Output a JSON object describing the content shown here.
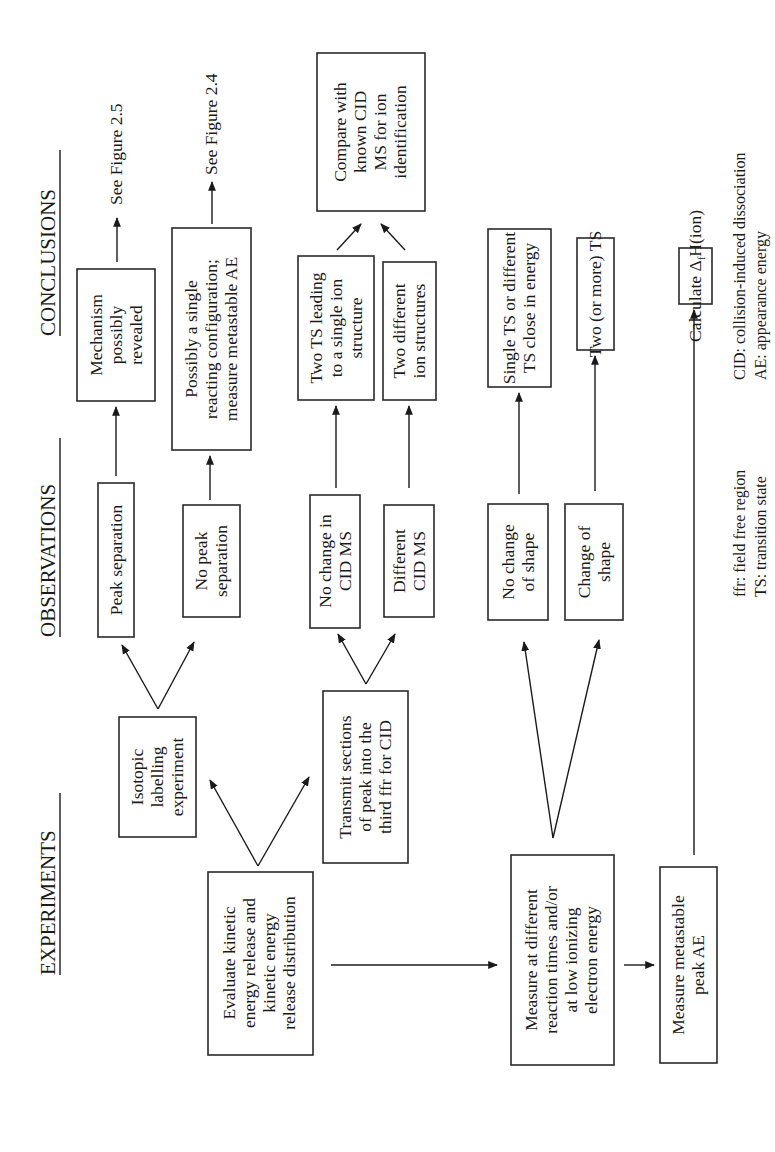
{
  "headers": {
    "experiments": "EXPERIMENTS",
    "observations": "OBSERVATIONS",
    "conclusions": "CONCLUSIONS"
  },
  "experiments": {
    "evaluate": [
      "Evaluate kinetic",
      "energy release and",
      "kinetic energy",
      "release distribution"
    ],
    "isotopic": [
      "Isotopic",
      "labelling",
      "experiment"
    ],
    "transmit": [
      "Transmit sections",
      "of peak into the",
      "third ffr for CID"
    ],
    "measure": [
      "Measure at different",
      "reaction times and/or",
      "at low ionizing",
      "electron energy"
    ],
    "metastable_ae": [
      "Measure metastable",
      "peak AE"
    ]
  },
  "observations": {
    "peak_separation": [
      "Peak  separation"
    ],
    "no_peak_separation": [
      "No peak",
      "separation"
    ],
    "no_change_cid": [
      "No change in",
      "CID MS"
    ],
    "different_cid": [
      "Different",
      "CID MS"
    ],
    "no_change_shape": [
      "No change",
      "of shape"
    ],
    "change_shape": [
      "Change of",
      "shape"
    ]
  },
  "conclusions": {
    "mechanism": [
      "Mechanism",
      "possibly",
      "revealed"
    ],
    "single_config": [
      "Possibly a single",
      "reacting configuration;",
      "measure metastable AE"
    ],
    "two_ts_single": [
      "Two TS leading",
      "to a single ion",
      "structure"
    ],
    "two_structures": [
      "Two different",
      "ion structures"
    ],
    "compare": [
      "Compare with",
      "known CID",
      "MS for ion",
      "identification"
    ],
    "single_ts": [
      "Single TS or different",
      "TS close in energy"
    ],
    "two_more_ts": [
      "Two (or more) TS"
    ],
    "calculate": {
      "prefix": "Calculate Δ",
      "sub": "f",
      "suffix": "H(ion)"
    },
    "see_fig_25": "See Figure 2.5",
    "see_fig_24": "See Figure 2.4"
  },
  "footnotes": {
    "ffr": "ffr: field free region",
    "ts": "TS: transition state",
    "cid": "CID: collision-induced dissociation",
    "ae": "AE: appearance energy"
  },
  "colors": {
    "ink": "#1a1a1a",
    "background": "#ffffff"
  }
}
